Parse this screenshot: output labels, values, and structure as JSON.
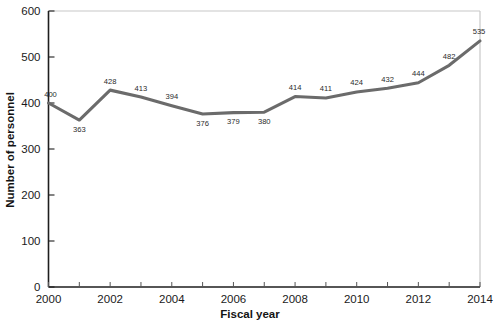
{
  "chart_data": {
    "type": "line",
    "title": "",
    "xlabel": "Fiscal year",
    "ylabel": "Number of personnel",
    "categories": [
      2000,
      2001,
      2002,
      2003,
      2004,
      2005,
      2006,
      2007,
      2008,
      2009,
      2010,
      2011,
      2012,
      2013,
      2014
    ],
    "values": [
      400,
      363,
      428,
      413,
      394,
      376,
      379,
      380,
      414,
      411,
      424,
      432,
      444,
      482,
      535
    ],
    "point_labels": [
      "400",
      "363",
      "428",
      "413",
      "394",
      "376",
      "379",
      "380",
      "414",
      "411",
      "424",
      "432",
      "444",
      "482",
      "535"
    ],
    "xlim": [
      2000,
      2014
    ],
    "ylim": [
      0,
      600
    ],
    "yticks": [
      0,
      100,
      200,
      300,
      400,
      500,
      600
    ],
    "ytick_labels": [
      "0",
      "100",
      "200",
      "300",
      "400",
      "500",
      "600"
    ],
    "xticks": [
      2000,
      2001,
      2002,
      2003,
      2004,
      2005,
      2006,
      2007,
      2008,
      2009,
      2010,
      2011,
      2012,
      2013,
      2014
    ],
    "xtick_labels_shown": [
      "2000",
      "2002",
      "2004",
      "2006",
      "2008",
      "2010",
      "2012",
      "2014"
    ],
    "grid": false,
    "legend": false,
    "series_color": "#6b6b6b",
    "axis_color": "#1e1e1e",
    "frame_color": "#c8c8c8"
  }
}
